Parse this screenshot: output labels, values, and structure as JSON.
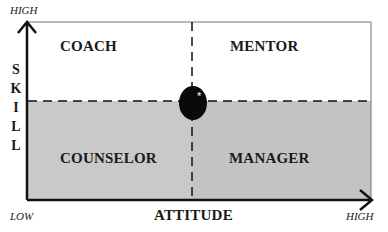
{
  "diagram": {
    "type": "quadrant-matrix",
    "x_axis": {
      "label": "ATTITUDE",
      "low": "LOW",
      "high": "HIGH"
    },
    "y_axis": {
      "label": "SKILL",
      "letters": [
        "S",
        "K",
        "I",
        "L",
        "L"
      ],
      "high": "HIGH"
    },
    "quadrants": {
      "top_left": "COACH",
      "top_right": "MENTOR",
      "bottom_left": "COUNSELOR",
      "bottom_right": "MANAGER"
    },
    "center_marker": {
      "shape": "black-ellipse",
      "symbol": "*"
    },
    "colors": {
      "top_fill": "#ffffff",
      "bottom_fill": "#c9c9c9",
      "line": "#111111"
    }
  }
}
